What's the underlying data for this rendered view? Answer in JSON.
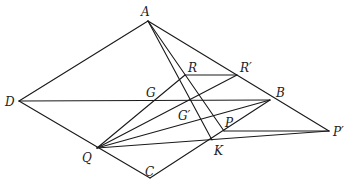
{
  "figure": {
    "type": "geometry-diagram",
    "points": {
      "A": {
        "label": "A",
        "x": 148,
        "y": 21,
        "lx": 141,
        "ly": 16
      },
      "D": {
        "label": "D",
        "x": 19,
        "y": 101,
        "lx": 5,
        "ly": 106
      },
      "B": {
        "label": "B",
        "x": 270,
        "y": 100,
        "lx": 276,
        "ly": 97
      },
      "C": {
        "label": "C",
        "x": 150,
        "y": 178,
        "lx": 145,
        "ly": 176
      },
      "Q": {
        "label": "Q",
        "x": 97,
        "y": 148,
        "lx": 82,
        "ly": 162
      },
      "R": {
        "label": "R",
        "x": 185,
        "y": 75,
        "lx": 188,
        "ly": 72
      },
      "Rp": {
        "label": "R′",
        "x": 237,
        "y": 75,
        "lx": 240,
        "ly": 72
      },
      "G": {
        "label": "G",
        "x": 159,
        "y": 101,
        "lx": 146,
        "ly": 97
      },
      "Gp": {
        "label": "G′",
        "x": 193,
        "y": 110,
        "lx": 178,
        "ly": 120
      },
      "P": {
        "label": "P",
        "x": 224,
        "y": 131,
        "lx": 225,
        "ly": 127
      },
      "Pp": {
        "label": "P′",
        "x": 329,
        "y": 131,
        "lx": 333,
        "ly": 136
      },
      "K": {
        "label": "K",
        "x": 212,
        "y": 140,
        "lx": 214,
        "ly": 155
      }
    },
    "segments": [
      [
        "A",
        "D"
      ],
      [
        "A",
        "Pp"
      ],
      [
        "D",
        "C"
      ],
      [
        "C",
        "B"
      ],
      [
        "D",
        "B"
      ],
      [
        "A",
        "K"
      ],
      [
        "A",
        "P"
      ],
      [
        "R",
        "Rp"
      ],
      [
        "Q",
        "R"
      ],
      [
        "Q",
        "Rp"
      ],
      [
        "Q",
        "Pp"
      ],
      [
        "P",
        "Pp"
      ],
      [
        "Q",
        "B"
      ]
    ]
  }
}
